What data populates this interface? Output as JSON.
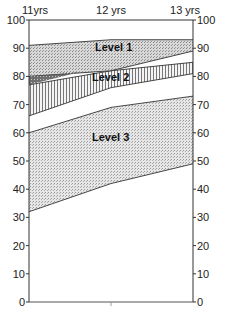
{
  "chart_data": {
    "type": "area",
    "title": "",
    "xlabel": "",
    "ylabel": "",
    "categories": [
      "11yrs",
      "12 yrs",
      "13 yrs"
    ],
    "ylim": [
      0,
      100
    ],
    "yticks": [
      0,
      10,
      20,
      30,
      40,
      50,
      60,
      70,
      80,
      90,
      100
    ],
    "grid": false,
    "legend": "inline labels",
    "series": [
      {
        "name": "Level 1",
        "label": "Level 1",
        "upper": [
          91,
          93,
          93
        ],
        "lower": [
          80,
          82,
          89
        ],
        "pattern": "stipple",
        "fill": "#d9d9d9"
      },
      {
        "name": "Level 2",
        "label": "Level 2",
        "upper": [
          77,
          82,
          85
        ],
        "lower": [
          66,
          76,
          81
        ],
        "pattern": "vertical-hatch",
        "fill": "#efefef"
      },
      {
        "name": "Level 3",
        "label": "Level 3",
        "upper": [
          60,
          69,
          73
        ],
        "lower": [
          32,
          42,
          49
        ],
        "pattern": "stipple",
        "fill": "#e3e3e3"
      }
    ]
  },
  "axes": {
    "left_ticks": [
      "0",
      "10",
      "20",
      "30",
      "40",
      "50",
      "60",
      "70",
      "80",
      "90",
      "100"
    ],
    "right_ticks": [
      "0",
      "10",
      "20",
      "30",
      "40",
      "50",
      "60",
      "70",
      "80",
      "90",
      "100"
    ],
    "x_labels": [
      "11yrs",
      "12 yrs",
      "13 yrs"
    ]
  },
  "labels": {
    "level1": "Level 1",
    "level2": "Level 2",
    "level3": "Level 3"
  }
}
